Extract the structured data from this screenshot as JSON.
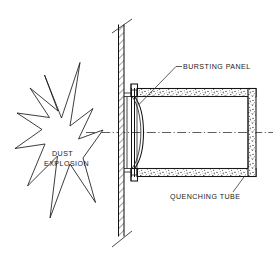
{
  "diagram": {
    "background_color": "#ffffff",
    "line_color": "#1a1a1a",
    "width": 273,
    "height": 258,
    "labels": {
      "bursting_panel": "BURSTING PANEL",
      "quenching_tube": "QUENCHING TUBE",
      "dust_explosion_line1": "DUST",
      "dust_explosion_line2": "EXPLOSION"
    },
    "components": [
      {
        "name": "vessel-wall",
        "description": "hatched vertical wall with break lines at top and bottom"
      },
      {
        "name": "bursting-panel",
        "description": "outward bulging rupture disc held between flanges"
      },
      {
        "name": "flange",
        "description": "bolted flange ring joining panel to tube"
      },
      {
        "name": "quenching-tube",
        "description": "horizontal stipple-filled duct extending right"
      },
      {
        "name": "dust-explosion",
        "description": "starburst symbol representing deflagration inside vessel"
      },
      {
        "name": "centerline",
        "description": "horizontal dash-dot axis of symmetry"
      }
    ]
  }
}
